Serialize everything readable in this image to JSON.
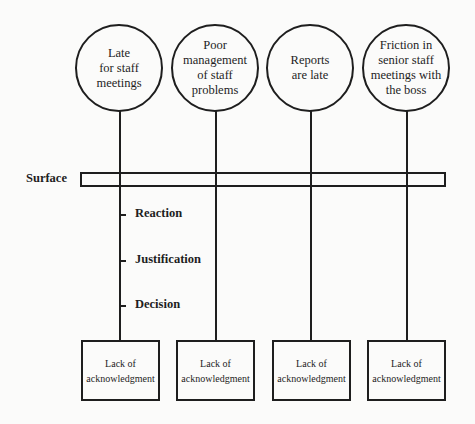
{
  "diagram": {
    "problems": [
      {
        "label": "Late\nfor staff\nmeetings"
      },
      {
        "label": "Poor\nmanagement\nof staff\nproblems"
      },
      {
        "label": "Reports\nare late"
      },
      {
        "label": "Friction in\nsenior staff\nmeetings with\nthe boss"
      }
    ],
    "surface_label": "Surface",
    "levels": [
      {
        "label": "Reaction"
      },
      {
        "label": "Justification"
      },
      {
        "label": "Decision"
      }
    ],
    "root_causes": [
      {
        "label": "Lack of\nacknowledgment"
      },
      {
        "label": "Lack of\nacknowledgment"
      },
      {
        "label": "Lack of\nacknowledgment"
      },
      {
        "label": "Lack of\nacknowledgment"
      }
    ]
  }
}
